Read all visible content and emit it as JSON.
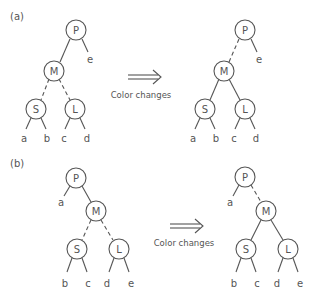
{
  "panels": [
    {
      "label": "(a)",
      "arrow_caption": "Color changes",
      "before": {
        "nodes": {
          "P": "P",
          "M": "M",
          "S": "S",
          "L": "L"
        },
        "leaves": {
          "a": "a",
          "b": "b",
          "c": "c",
          "d": "d",
          "e": "e"
        },
        "edges": {
          "P-M": "solid",
          "M-S": "dashed",
          "M-L": "dashed"
        }
      },
      "after": {
        "nodes": {
          "P": "P",
          "M": "M",
          "S": "S",
          "L": "L"
        },
        "leaves": {
          "a": "a",
          "b": "b",
          "c": "c",
          "d": "d",
          "e": "e"
        },
        "edges": {
          "P-M": "dashed",
          "M-S": "solid",
          "M-L": "solid"
        }
      }
    },
    {
      "label": "(b)",
      "arrow_caption": "Color changes",
      "before": {
        "nodes": {
          "P": "P",
          "M": "M",
          "S": "S",
          "L": "L"
        },
        "leaves": {
          "a": "a",
          "b": "b",
          "c": "c",
          "d": "d",
          "e": "e"
        },
        "edges": {
          "P-M": "solid",
          "M-S": "dashed",
          "M-L": "dashed"
        }
      },
      "after": {
        "nodes": {
          "P": "P",
          "M": "M",
          "S": "S",
          "L": "L"
        },
        "leaves": {
          "a": "a",
          "b": "b",
          "c": "c",
          "d": "d",
          "e": "e"
        },
        "edges": {
          "P-M": "dashed",
          "M-S": "solid",
          "M-L": "solid"
        }
      }
    }
  ],
  "colors": {
    "stroke": "#555555",
    "text": "#555555",
    "background": "#ffffff"
  }
}
